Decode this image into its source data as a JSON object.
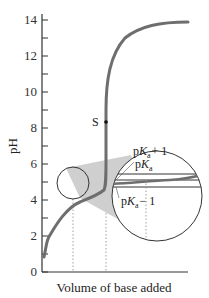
{
  "chart_data": {
    "type": "line",
    "title": "",
    "xlabel": "Volume of base added",
    "ylabel": "pH",
    "ylim": [
      0,
      14
    ],
    "yticks": [
      0,
      2,
      4,
      6,
      8,
      10,
      12,
      14
    ],
    "ytick_labels": [
      "0",
      "2",
      "4",
      "6",
      "8",
      "10",
      "12",
      "14"
    ],
    "minor_yticks": [
      1,
      3,
      5,
      7,
      9,
      11,
      13
    ],
    "grid": false,
    "legend": null,
    "series": [
      {
        "name": "titration curve",
        "color": "#6e6e6e",
        "x": [
          0.0,
          0.05,
          0.1,
          0.2,
          0.3,
          0.4,
          0.5,
          0.6,
          0.7,
          0.8,
          0.85,
          0.9,
          0.95,
          1.0,
          1.05,
          1.1,
          1.2,
          1.4,
          1.6
        ],
        "y": [
          2.4,
          3.0,
          3.4,
          3.8,
          4.0,
          4.2,
          4.4,
          4.6,
          4.9,
          5.3,
          5.6,
          6.2,
          7.5,
          8.4,
          10.0,
          11.5,
          12.8,
          13.5,
          13.7
        ]
      }
    ],
    "annotations": [
      {
        "text": "S",
        "x": 1.0,
        "y": 8.4,
        "marker": "point"
      },
      {
        "text": "pKa + 1",
        "type": "horizontal-line-in-inset"
      },
      {
        "text": "pKa",
        "type": "horizontal-line-in-inset"
      },
      {
        "text": "pKa − 1",
        "type": "horizontal-line-in-inset"
      }
    ],
    "inset": {
      "description": "magnified circle of buffer region around pKa",
      "source_region_center": {
        "x": 0.3,
        "y": 4.0
      }
    },
    "dotted_verticals": [
      "start of buffer region",
      "equivalence point S",
      "inset buffer extent"
    ]
  },
  "labels": {
    "s_point": "S",
    "pka_plus": {
      "p": "p",
      "k": "K",
      "sub": "a",
      "suffix": "+ 1"
    },
    "pka": {
      "p": "p",
      "k": "K",
      "sub": "a",
      "suffix": ""
    },
    "pka_minus": {
      "p": "p",
      "k": "K",
      "sub": "a",
      "suffix": "− 1"
    }
  }
}
